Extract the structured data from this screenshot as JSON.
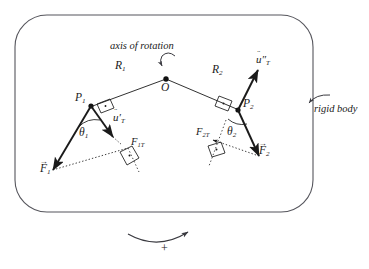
{
  "figure": {
    "kind": "physics-free-body-diagram",
    "title_text": "axis of rotation",
    "body_label": "rigid body",
    "sign_label": "+",
    "background_color": "#ffffff",
    "stroke_color": "#1a1a1a",
    "outline_color": "#4a4a50"
  },
  "outline": {
    "name": "rigid body boundary",
    "shape": "rounded-rectangle",
    "x": 15,
    "y": 15,
    "width": 298,
    "height": 197,
    "radius": 32
  },
  "pivot": {
    "label": "O",
    "description": "axis of rotation point",
    "x": 166,
    "y": 79
  },
  "arms": [
    {
      "label": "R",
      "subscript": "1",
      "from": "O",
      "to": "P1",
      "label_x": 115,
      "label_y": 66
    },
    {
      "label": "R",
      "subscript": "2",
      "from": "O",
      "to": "P2",
      "label_x": 212,
      "label_y": 70
    }
  ],
  "points": [
    {
      "label": "P",
      "subscript": "1",
      "x": 92,
      "y": 106,
      "label_x": 76,
      "label_y": 96
    },
    {
      "label": "P",
      "subscript": "2",
      "x": 237,
      "y": 109,
      "label_x": 243,
      "label_y": 101
    }
  ],
  "vectors": [
    {
      "name": "unit tangent vector at P1",
      "base": "u",
      "accent": "̈",
      "primes": "′",
      "subscript": "T",
      "label_x": 113,
      "label_y": 117
    },
    {
      "name": "unit tangent vector at P2",
      "base": "u",
      "accent": "̈",
      "primes": "″",
      "subscript": "T",
      "label_x": 256,
      "label_y": 58
    },
    {
      "name": "force at P1",
      "base": "F",
      "accent": "→",
      "primes": "",
      "subscript": "1",
      "label_x": 42,
      "label_y": 167
    },
    {
      "name": "force at P2",
      "base": "F",
      "accent": "→",
      "primes": "",
      "subscript": "2",
      "label_x": 259,
      "label_y": 149
    }
  ],
  "components": [
    {
      "name": "tangential component of F1",
      "label": "F",
      "subscript": "1T",
      "label_x": 122,
      "label_y": 140
    },
    {
      "name": "tangential component of F2",
      "label": "F",
      "subscript": "2T",
      "label_x": 200,
      "label_y": 130
    }
  ],
  "angles": [
    {
      "label": "θ",
      "subscript": "1",
      "label_x": 81,
      "label_y": 132
    },
    {
      "label": "θ",
      "subscript": "2",
      "label_x": 228,
      "label_y": 131
    }
  ],
  "annotations": [
    {
      "name": "axis-of-rotation-caption",
      "text": "axis of rotation",
      "x": 110,
      "y": 41
    },
    {
      "name": "rigid-body-caption",
      "text": "rigid body",
      "x": 314,
      "y": 110
    },
    {
      "name": "positive-direction-sign",
      "text": "+",
      "x": 161,
      "y": 248
    }
  ]
}
